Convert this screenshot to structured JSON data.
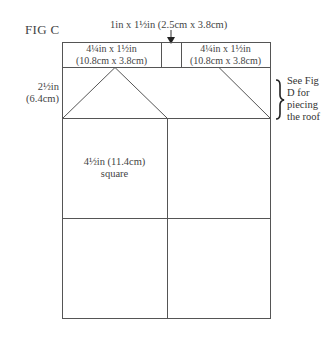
{
  "figure": {
    "label": "FIG C",
    "top_callout": "1in x 1½in (2.5cm x 3.8cm)",
    "strip_left": {
      "line1": "4¼in x 1½in",
      "line2": "(10.8cm x 3.8cm)"
    },
    "strip_right": {
      "line1": "4¼in x 1½in",
      "line2": "(10.8cm x 3.8cm)"
    },
    "roof_height": {
      "line1": "2½in",
      "line2": "(6.4cm)"
    },
    "roof_note": {
      "lines": [
        "See Fig",
        "D for",
        "piecing",
        "the roof"
      ]
    },
    "square": {
      "line1": "4½in (11.4cm)",
      "line2": "square"
    },
    "colors": {
      "line": "#555555",
      "text": "#444444",
      "background": "#ffffff"
    }
  }
}
